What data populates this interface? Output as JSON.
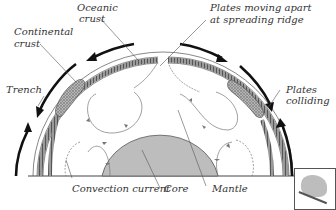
{
  "diagram": {
    "type": "plate-tectonics-cross-section",
    "labels": {
      "oceanic_crust": "Oceanic\ncrust",
      "oceanic_crust_l1": "Oceanic",
      "oceanic_crust_l2": "crust",
      "continental_crust_l1": "Continental",
      "continental_crust_l2": "crust",
      "plates_apart_l1": "Plates moving apart",
      "plates_apart_l2": "at spreading ridge",
      "trench": "Trench",
      "plates_colliding_l1": "Plates",
      "plates_colliding_l2": "colliding",
      "convection_current": "Convection current",
      "core": "Core",
      "mantle": "Mantle"
    },
    "colors": {
      "outline": "#333333",
      "crust_fill": "#8a8a8a",
      "continental_fill": "#a0a0a0",
      "core_fill": "#bdbdbd",
      "arrow": "#111111",
      "background": "#ffffff"
    }
  }
}
